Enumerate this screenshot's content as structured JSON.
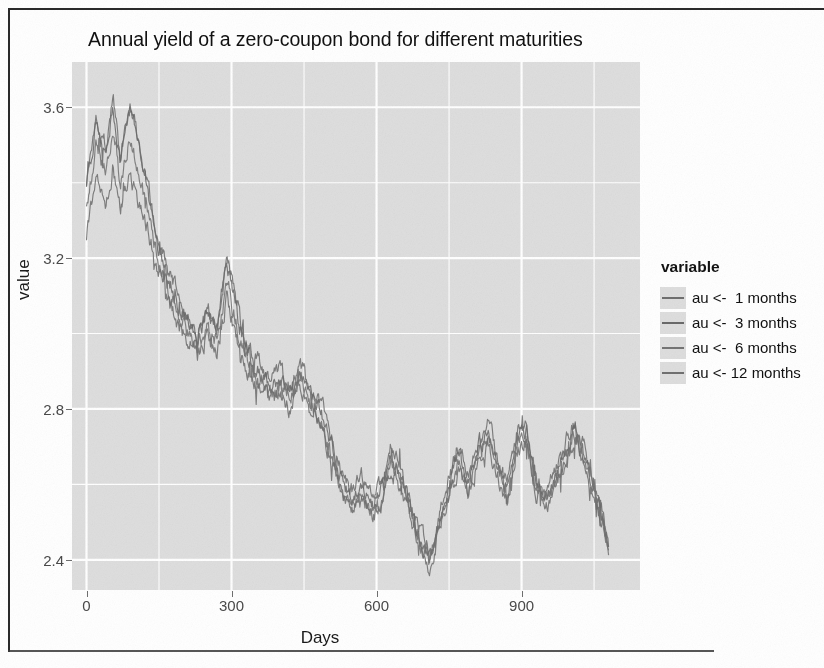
{
  "figure": {
    "title": "Annual yield of a zero-coupon bond for different maturities",
    "x_axis_title": "Days",
    "y_axis_title": "value"
  },
  "legend": {
    "title": "variable",
    "items": [
      {
        "label": "au <-  1 months",
        "color": "#6f6f6f"
      },
      {
        "label": "au <-  3 months",
        "color": "#6a6a6a"
      },
      {
        "label": "au <-  6 months",
        "color": "#747474"
      },
      {
        "label": "au <- 12 months",
        "color": "#707070"
      }
    ]
  },
  "axes": {
    "x_ticks": [
      0,
      300,
      600,
      900
    ],
    "y_ticks": [
      2.4,
      2.8,
      3.2,
      3.6
    ],
    "xlim": [
      -30,
      1145
    ],
    "ylim": [
      2.32,
      3.72
    ],
    "grid": true,
    "panel_background": "#dedede",
    "grid_color": "#ffffff"
  },
  "chart_data": {
    "type": "line",
    "title": "Annual yield of a zero-coupon bond for different maturities",
    "xlabel": "Days",
    "ylabel": "value",
    "xlim": [
      -30,
      1145
    ],
    "ylim": [
      2.32,
      3.72
    ],
    "x_ticks": [
      0,
      300,
      600,
      900
    ],
    "y_ticks": [
      2.4,
      2.8,
      3.2,
      3.6
    ],
    "grid": true,
    "legend_position": "right",
    "legend_title": "variable",
    "x_description": "Days, simulated daily observations from 0 to about 1080",
    "noise_amplitude": 0.035,
    "series": [
      {
        "name": "au <-  1 months",
        "color": "#6f6f6f",
        "offset": 0.0,
        "control_points": [
          [
            0,
            3.4
          ],
          [
            20,
            3.58
          ],
          [
            40,
            3.5
          ],
          [
            55,
            3.63
          ],
          [
            70,
            3.47
          ],
          [
            90,
            3.62
          ],
          [
            110,
            3.5
          ],
          [
            130,
            3.38
          ],
          [
            150,
            3.24
          ],
          [
            170,
            3.16
          ],
          [
            190,
            3.1
          ],
          [
            210,
            3.05
          ],
          [
            230,
            3.0
          ],
          [
            250,
            3.07
          ],
          [
            270,
            3.02
          ],
          [
            290,
            3.2
          ],
          [
            305,
            3.12
          ],
          [
            320,
            3.02
          ],
          [
            340,
            2.95
          ],
          [
            360,
            2.92
          ],
          [
            380,
            2.88
          ],
          [
            400,
            2.9
          ],
          [
            420,
            2.86
          ],
          [
            440,
            2.92
          ],
          [
            455,
            2.88
          ],
          [
            470,
            2.84
          ],
          [
            490,
            2.8
          ],
          [
            510,
            2.7
          ],
          [
            530,
            2.62
          ],
          [
            550,
            2.58
          ],
          [
            570,
            2.62
          ],
          [
            590,
            2.56
          ],
          [
            610,
            2.6
          ],
          [
            630,
            2.7
          ],
          [
            650,
            2.64
          ],
          [
            670,
            2.56
          ],
          [
            690,
            2.48
          ],
          [
            710,
            2.42
          ],
          [
            730,
            2.52
          ],
          [
            750,
            2.62
          ],
          [
            770,
            2.7
          ],
          [
            790,
            2.62
          ],
          [
            810,
            2.72
          ],
          [
            830,
            2.76
          ],
          [
            850,
            2.68
          ],
          [
            870,
            2.6
          ],
          [
            890,
            2.74
          ],
          [
            910,
            2.76
          ],
          [
            930,
            2.62
          ],
          [
            950,
            2.58
          ],
          [
            970,
            2.64
          ],
          [
            990,
            2.7
          ],
          [
            1010,
            2.78
          ],
          [
            1030,
            2.7
          ],
          [
            1050,
            2.6
          ],
          [
            1065,
            2.54
          ],
          [
            1080,
            2.44
          ]
        ]
      },
      {
        "name": "au <-  3 months",
        "color": "#6a6a6a",
        "offset": -0.02,
        "control_points": [
          [
            0,
            3.38
          ],
          [
            20,
            3.56
          ],
          [
            40,
            3.48
          ],
          [
            55,
            3.6
          ],
          [
            70,
            3.45
          ],
          [
            90,
            3.59
          ],
          [
            110,
            3.48
          ],
          [
            130,
            3.36
          ],
          [
            150,
            3.22
          ],
          [
            170,
            3.14
          ],
          [
            190,
            3.08
          ],
          [
            210,
            3.03
          ],
          [
            230,
            2.98
          ],
          [
            250,
            3.05
          ],
          [
            270,
            3.0
          ],
          [
            290,
            3.18
          ],
          [
            305,
            3.1
          ],
          [
            320,
            3.0
          ],
          [
            340,
            2.93
          ],
          [
            360,
            2.9
          ],
          [
            380,
            2.86
          ],
          [
            400,
            2.88
          ],
          [
            420,
            2.84
          ],
          [
            440,
            2.9
          ],
          [
            455,
            2.86
          ],
          [
            470,
            2.82
          ],
          [
            490,
            2.78
          ],
          [
            510,
            2.68
          ],
          [
            530,
            2.6
          ],
          [
            550,
            2.56
          ],
          [
            570,
            2.6
          ],
          [
            590,
            2.54
          ],
          [
            610,
            2.58
          ],
          [
            630,
            2.68
          ],
          [
            650,
            2.62
          ],
          [
            670,
            2.54
          ],
          [
            690,
            2.46
          ],
          [
            710,
            2.4
          ],
          [
            730,
            2.5
          ],
          [
            750,
            2.6
          ],
          [
            770,
            2.68
          ],
          [
            790,
            2.6
          ],
          [
            810,
            2.7
          ],
          [
            830,
            2.74
          ],
          [
            850,
            2.66
          ],
          [
            870,
            2.58
          ],
          [
            890,
            2.72
          ],
          [
            910,
            2.74
          ],
          [
            930,
            2.6
          ],
          [
            950,
            2.56
          ],
          [
            970,
            2.62
          ],
          [
            990,
            2.68
          ],
          [
            1010,
            2.76
          ],
          [
            1030,
            2.68
          ],
          [
            1050,
            2.58
          ],
          [
            1065,
            2.52
          ],
          [
            1080,
            2.43
          ]
        ]
      },
      {
        "name": "au <-  6 months",
        "color": "#747474",
        "offset": -0.08,
        "control_points": [
          [
            0,
            3.33
          ],
          [
            20,
            3.5
          ],
          [
            40,
            3.42
          ],
          [
            55,
            3.54
          ],
          [
            70,
            3.4
          ],
          [
            90,
            3.52
          ],
          [
            110,
            3.42
          ],
          [
            130,
            3.31
          ],
          [
            150,
            3.19
          ],
          [
            170,
            3.11
          ],
          [
            190,
            3.05
          ],
          [
            210,
            3.0
          ],
          [
            230,
            2.96
          ],
          [
            250,
            3.02
          ],
          [
            270,
            2.98
          ],
          [
            290,
            3.14
          ],
          [
            305,
            3.06
          ],
          [
            320,
            2.97
          ],
          [
            340,
            2.91
          ],
          [
            360,
            2.88
          ],
          [
            380,
            2.84
          ],
          [
            400,
            2.86
          ],
          [
            420,
            2.82
          ],
          [
            440,
            2.88
          ],
          [
            455,
            2.84
          ],
          [
            470,
            2.8
          ],
          [
            490,
            2.76
          ],
          [
            510,
            2.66
          ],
          [
            530,
            2.58
          ],
          [
            550,
            2.54
          ],
          [
            570,
            2.58
          ],
          [
            590,
            2.52
          ],
          [
            610,
            2.56
          ],
          [
            630,
            2.66
          ],
          [
            650,
            2.6
          ],
          [
            670,
            2.52
          ],
          [
            690,
            2.45
          ],
          [
            710,
            2.39
          ],
          [
            730,
            2.49
          ],
          [
            750,
            2.58
          ],
          [
            770,
            2.66
          ],
          [
            790,
            2.58
          ],
          [
            810,
            2.68
          ],
          [
            830,
            2.72
          ],
          [
            850,
            2.64
          ],
          [
            870,
            2.56
          ],
          [
            890,
            2.7
          ],
          [
            910,
            2.72
          ],
          [
            930,
            2.59
          ],
          [
            950,
            2.55
          ],
          [
            970,
            2.6
          ],
          [
            990,
            2.66
          ],
          [
            1010,
            2.74
          ],
          [
            1030,
            2.66
          ],
          [
            1050,
            2.57
          ],
          [
            1065,
            2.51
          ],
          [
            1080,
            2.43
          ]
        ]
      },
      {
        "name": "au <- 12 months",
        "color": "#707070",
        "offset": -0.18,
        "control_points": [
          [
            0,
            3.26
          ],
          [
            20,
            3.4
          ],
          [
            40,
            3.34
          ],
          [
            55,
            3.44
          ],
          [
            70,
            3.32
          ],
          [
            90,
            3.42
          ],
          [
            110,
            3.34
          ],
          [
            130,
            3.26
          ],
          [
            150,
            3.15
          ],
          [
            170,
            3.08
          ],
          [
            190,
            3.02
          ],
          [
            210,
            2.98
          ],
          [
            230,
            2.94
          ],
          [
            250,
            2.99
          ],
          [
            270,
            2.95
          ],
          [
            290,
            3.09
          ],
          [
            305,
            3.02
          ],
          [
            320,
            2.94
          ],
          [
            340,
            2.89
          ],
          [
            360,
            2.86
          ],
          [
            380,
            2.82
          ],
          [
            400,
            2.84
          ],
          [
            420,
            2.8
          ],
          [
            440,
            2.86
          ],
          [
            455,
            2.82
          ],
          [
            470,
            2.78
          ],
          [
            490,
            2.74
          ],
          [
            510,
            2.64
          ],
          [
            530,
            2.57
          ],
          [
            550,
            2.53
          ],
          [
            570,
            2.57
          ],
          [
            590,
            2.51
          ],
          [
            610,
            2.55
          ],
          [
            630,
            2.64
          ],
          [
            650,
            2.59
          ],
          [
            670,
            2.51
          ],
          [
            690,
            2.44
          ],
          [
            710,
            2.38
          ],
          [
            730,
            2.48
          ],
          [
            750,
            2.57
          ],
          [
            770,
            2.65
          ],
          [
            790,
            2.57
          ],
          [
            810,
            2.67
          ],
          [
            830,
            2.71
          ],
          [
            850,
            2.63
          ],
          [
            870,
            2.55
          ],
          [
            890,
            2.69
          ],
          [
            910,
            2.71
          ],
          [
            930,
            2.58
          ],
          [
            950,
            2.54
          ],
          [
            970,
            2.59
          ],
          [
            990,
            2.65
          ],
          [
            1010,
            2.73
          ],
          [
            1030,
            2.65
          ],
          [
            1050,
            2.56
          ],
          [
            1065,
            2.5
          ],
          [
            1080,
            2.42
          ]
        ]
      }
    ]
  }
}
